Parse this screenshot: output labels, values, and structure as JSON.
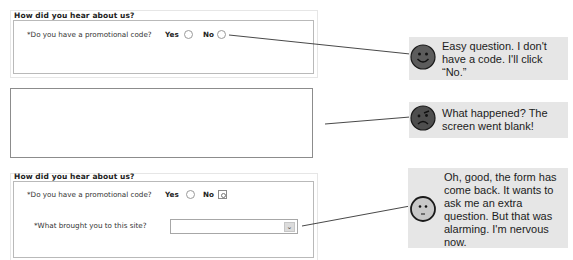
{
  "panel1": {
    "title": "How did you hear about us?",
    "question": "*Do you have a promotional code?",
    "options": [
      {
        "label": "Yes",
        "checked": false
      },
      {
        "label": "No",
        "checked": false
      }
    ]
  },
  "panel2": {
    "state": "blank"
  },
  "panel3": {
    "title": "How did you hear about us?",
    "question": "*Do you have a promotional code?",
    "options": [
      {
        "label": "Yes",
        "checked": false
      },
      {
        "label": "No",
        "checked": true
      }
    ],
    "question2": "*What brought you to this site?",
    "select_value": "",
    "select_arrow": "chevron-down-icon"
  },
  "callouts": [
    {
      "face": "happy-face-icon",
      "text": "Easy question. I don't have a code. I'll click “No.”"
    },
    {
      "face": "angry-face-icon",
      "text": "What happened? The screen went blank!"
    },
    {
      "face": "nervous-face-icon",
      "text": "Oh, good, the form has come back. It wants to ask me an extra question. But that was alarming. I'm nervous now."
    }
  ],
  "colors": {
    "callout_bg": "#e6e6e6",
    "face_dark": "#555555",
    "face_light": "#c8c8c8",
    "connector": "#333333"
  }
}
